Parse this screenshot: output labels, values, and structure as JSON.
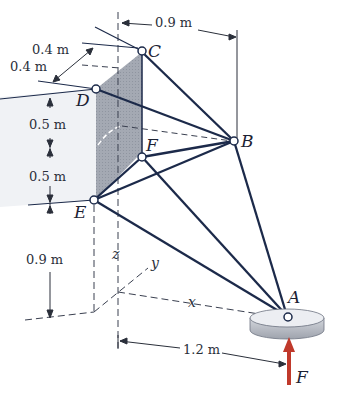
{
  "figure": {
    "type": "3D space truss / tripod structure",
    "joints": {
      "A": "A",
      "B": "B",
      "C": "C",
      "D": "D",
      "E": "E",
      "F": "F"
    },
    "axes": {
      "x": "x",
      "y": "y",
      "z": "z"
    },
    "force_label": "F",
    "dimensions": {
      "top_width": "0.9 m",
      "depth_upper": "0.4 m",
      "depth_lower": "0.4 m",
      "vertical_upper": "0.5 m",
      "vertical_lower": "0.5 m",
      "height_base": "0.9 m",
      "horizontal_base": "1.2 m"
    },
    "colors": {
      "members": "#1c2a4a",
      "force_arrow": "#c0392b",
      "wall_shade": "#9aa0ab",
      "wall_light": "#eef0f4",
      "disk_top": "#eceef2",
      "disk_side": "#b8bcc6"
    }
  }
}
